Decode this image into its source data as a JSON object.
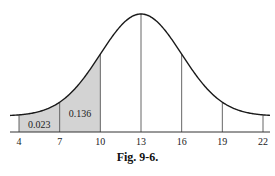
{
  "chart_data": {
    "type": "area",
    "title": "",
    "caption": "Fig. 9-6.",
    "distribution": "normal",
    "mean": 13,
    "sd": 3,
    "xlabel": "",
    "ylabel": "",
    "x_ticks": [
      4,
      7,
      10,
      13,
      16,
      19,
      22
    ],
    "xlim": [
      3,
      23
    ],
    "vertical_lines_at": [
      4,
      7,
      10,
      13,
      16,
      19,
      22
    ],
    "shaded_regions": [
      {
        "from": 4,
        "to": 7,
        "label": "0.023"
      },
      {
        "from": 7,
        "to": 10,
        "label": "0.136"
      }
    ],
    "grid": false,
    "legend": false
  },
  "colors": {
    "curve": "#1a1a1a",
    "shade": "#d3d3d3",
    "axis": "#333333"
  }
}
